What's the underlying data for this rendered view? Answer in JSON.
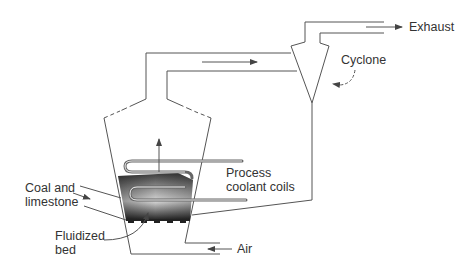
{
  "diagram": {
    "labels": {
      "exhaust": "Exhaust",
      "cyclone": "Cyclone",
      "process_coolant_line1": "Process",
      "process_coolant_line2": "coolant coils",
      "coal_line1": "Coal and",
      "coal_line2": "limestone",
      "fluidized_line1": "Fluidized",
      "fluidized_line2": "bed",
      "air": "Air"
    },
    "colors": {
      "line": "#555555",
      "text": "#333333",
      "bed_dark": "#2a2a2a",
      "bed_light": "#e8e8e8",
      "coil": "#666666"
    }
  }
}
